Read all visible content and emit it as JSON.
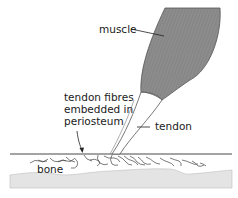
{
  "diagram": {
    "labels": {
      "muscle": "muscle",
      "tendon_fibres_line1": "tendon fibres",
      "tendon_fibres_line2": "embedded in",
      "tendon_fibres_line3": "periosteum",
      "tendon": "tendon",
      "bone": "bone"
    },
    "colors": {
      "muscle_fill": "#8a8a8a",
      "muscle_stroke": "#555555",
      "bone_fill": "#e4e4e4",
      "line": "#333333",
      "background": "#ffffff"
    }
  }
}
